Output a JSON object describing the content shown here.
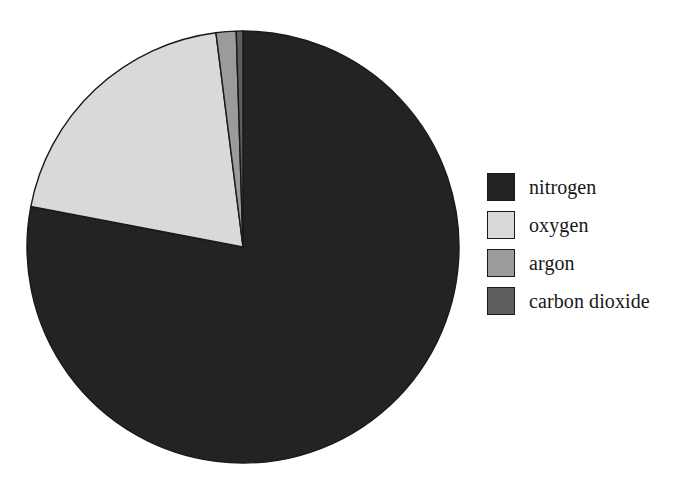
{
  "figure": {
    "background_color": "#ffffff",
    "outline_color": "#1a1a1a"
  },
  "chart_data": {
    "type": "pie",
    "title": "",
    "subtitle": "",
    "xlabel": "",
    "ylabel": "",
    "grid": false,
    "legend_position": "right",
    "start_angle_deg": 90,
    "direction": "clockwise",
    "units": "percent",
    "categories": [
      "nitrogen",
      "oxygen",
      "argon",
      "carbon dioxide"
    ],
    "values": [
      78.0,
      20.0,
      1.5,
      0.5
    ],
    "colors": [
      "#232323",
      "#d9d9d9",
      "#9b9b9b",
      "#5e5e5e"
    ],
    "annotations": [],
    "slices": [
      {
        "label": "nitrogen",
        "value": 78.0,
        "color": "#232323",
        "start_angle_deg": 90,
        "end_angle_deg": -190.8
      },
      {
        "label": "oxygen",
        "value": 20.0,
        "color": "#d9d9d9",
        "start_angle_deg": -190.8,
        "end_angle_deg": -262.8
      },
      {
        "label": "argon",
        "value": 1.5,
        "color": "#9b9b9b",
        "start_angle_deg": -262.8,
        "end_angle_deg": -268.2
      },
      {
        "label": "carbon dioxide",
        "value": 0.5,
        "color": "#5e5e5e",
        "start_angle_deg": -268.2,
        "end_angle_deg": -270.0
      }
    ]
  },
  "pie": {
    "center_x": 243,
    "center_y": 247,
    "radius": 216,
    "edge_color": "#1a1a1a",
    "edge_width": 1.4
  },
  "legend": {
    "items": [
      {
        "label": "nitrogen",
        "color": "#232323",
        "swatch_name": "legend-swatch-nitrogen"
      },
      {
        "label": "oxygen",
        "color": "#d9d9d9",
        "swatch_name": "legend-swatch-oxygen"
      },
      {
        "label": "argon",
        "color": "#9b9b9b",
        "swatch_name": "legend-swatch-argon"
      },
      {
        "label": "carbon dioxide",
        "color": "#5e5e5e",
        "swatch_name": "legend-swatch-carbon-dioxide"
      }
    ]
  }
}
